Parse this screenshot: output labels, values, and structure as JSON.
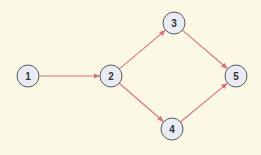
{
  "diagram": {
    "type": "directed-graph",
    "background": "#fbf8e6",
    "edge_color": "#d9727a",
    "node_fill": "#e9ecf3",
    "node_stroke": "#555a60",
    "node_radius": 11,
    "nodes": [
      {
        "id": "1",
        "label": "1",
        "x": 28,
        "y": 76
      },
      {
        "id": "2",
        "label": "2",
        "x": 111,
        "y": 76
      },
      {
        "id": "3",
        "label": "3",
        "x": 174,
        "y": 23
      },
      {
        "id": "4",
        "label": "4",
        "x": 172,
        "y": 129
      },
      {
        "id": "5",
        "label": "5",
        "x": 236,
        "y": 76
      }
    ],
    "edges": [
      {
        "from": "1",
        "to": "2"
      },
      {
        "from": "2",
        "to": "3"
      },
      {
        "from": "2",
        "to": "4"
      },
      {
        "from": "3",
        "to": "5"
      },
      {
        "from": "4",
        "to": "5"
      }
    ]
  }
}
